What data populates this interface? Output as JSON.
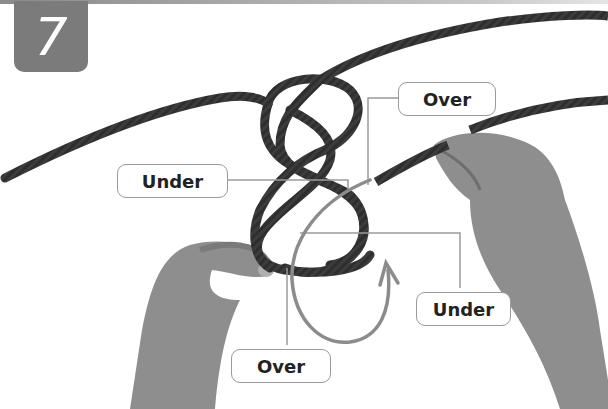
{
  "step": {
    "number": "7"
  },
  "labels": [
    {
      "id": "under-left",
      "text": "Under"
    },
    {
      "id": "over-top",
      "text": "Over"
    },
    {
      "id": "under-right",
      "text": "Under"
    },
    {
      "id": "over-bottom",
      "text": "Over"
    }
  ],
  "colors": {
    "badge": "#7b7b7b",
    "rope": "#2e2e2e",
    "skin": "#8e8e8e",
    "leader_line": "#9a9a9a",
    "arrow": "#8c8c8c"
  }
}
